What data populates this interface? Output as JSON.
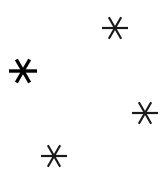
{
  "figure": {
    "width": 163,
    "height": 182,
    "background": "#ffffff",
    "marker": "asterisk",
    "marker_color": "#1a1a1a",
    "points": [
      {
        "id": "top-right",
        "x": 115,
        "y": 28,
        "size": 26,
        "stroke": 2.2,
        "color": "#1a1a1a"
      },
      {
        "id": "left",
        "x": 23,
        "y": 71,
        "size": 28,
        "stroke": 3.4,
        "color": "#000000"
      },
      {
        "id": "right",
        "x": 145,
        "y": 113,
        "size": 26,
        "stroke": 2.2,
        "color": "#1a1a1a"
      },
      {
        "id": "bottom",
        "x": 54,
        "y": 156,
        "size": 26,
        "stroke": 2.2,
        "color": "#1a1a1a"
      }
    ]
  }
}
